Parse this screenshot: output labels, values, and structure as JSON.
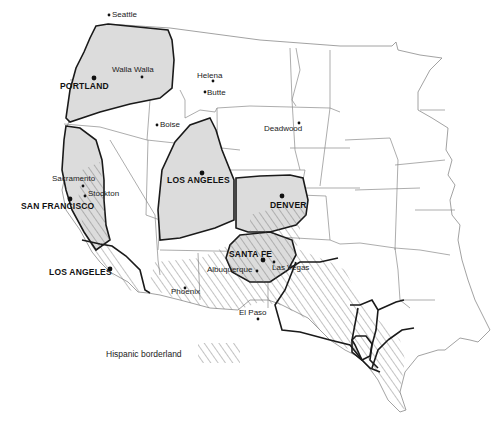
{
  "map": {
    "title": "",
    "regions": [
      {
        "name": "Portland region",
        "style": "gray-fill"
      },
      {
        "name": "San Francisco region",
        "style": "gray-fill"
      },
      {
        "name": "Salt Lake City region",
        "style": "gray-fill"
      },
      {
        "name": "Denver region",
        "style": "gray-fill"
      },
      {
        "name": "Santa Fe region",
        "style": "gray-fill-hatched"
      },
      {
        "name": "Los Angeles region",
        "style": "hatched"
      },
      {
        "name": "Texas subregions",
        "style": "hatched"
      }
    ],
    "major_cities": [
      {
        "label": "PORTLAND"
      },
      {
        "label": "SAN FRANCISCO"
      },
      {
        "label": "LOS ANGELES"
      },
      {
        "label": "SALT LAKE CITY"
      },
      {
        "label": "DENVER"
      },
      {
        "label": "SANTA FE"
      }
    ],
    "minor_cities": [
      {
        "label": "Seattle"
      },
      {
        "label": "Walla Walla"
      },
      {
        "label": "Helena"
      },
      {
        "label": "Butte"
      },
      {
        "label": "Boise"
      },
      {
        "label": "Deadwood"
      },
      {
        "label": "Sacramento"
      },
      {
        "label": "Stockton"
      },
      {
        "label": "Albuquerque"
      },
      {
        "label": "Las Vegas"
      },
      {
        "label": "Phoenix"
      },
      {
        "label": "El Paso"
      }
    ]
  },
  "legend": {
    "label": "Hispanic borderland",
    "swatch": "hatched"
  },
  "colors": {
    "region_fill": "#dcdcdc",
    "outline": "#1a1a1a",
    "state_line": "#8a8a8a",
    "hatch": "#6a6a6a",
    "background": "#ffffff"
  }
}
